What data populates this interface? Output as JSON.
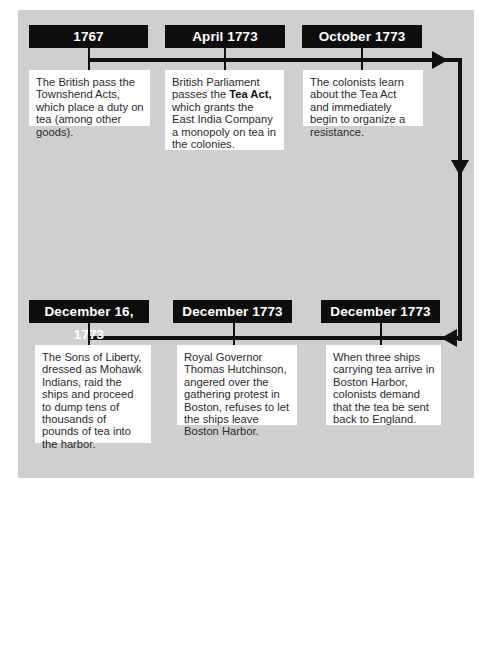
{
  "diagram": {
    "type": "timeline",
    "background_color": "#cfcfcf",
    "label_color": "#0d0d0d",
    "events": [
      {
        "date": "1767",
        "text": "The British pass the Townshend Acts, which place a duty on tea (among other goods)."
      },
      {
        "date": "April 1773",
        "text_before": "British Parliament passes the ",
        "text_bold": "Tea Act,",
        "text_after": " which grants the East India Company a monopoly on tea in the colonies."
      },
      {
        "date": "October 1773",
        "text": "The colonists learn about the Tea Act and immediately begin to organize a resistance."
      },
      {
        "date": "December 1773",
        "text": "When three ships carrying tea arrive in Boston Harbor, colonists demand that the tea be sent back to England."
      },
      {
        "date": "December 1773",
        "text": "Royal Governor Thomas Hutchinson, angered over the gathering protest in Boston, refuses to let the ships leave Boston Harbor."
      },
      {
        "date": "December 16, 1773",
        "text": "The Sons of Liberty, dressed as Mohawk Indians, raid the ships and proceed to dump tens of thousands of pounds of tea into the harbor."
      }
    ],
    "flow": {
      "top_row_direction": "left-to-right",
      "right_side_direction": "down",
      "bottom_row_direction": "right-to-left"
    }
  }
}
